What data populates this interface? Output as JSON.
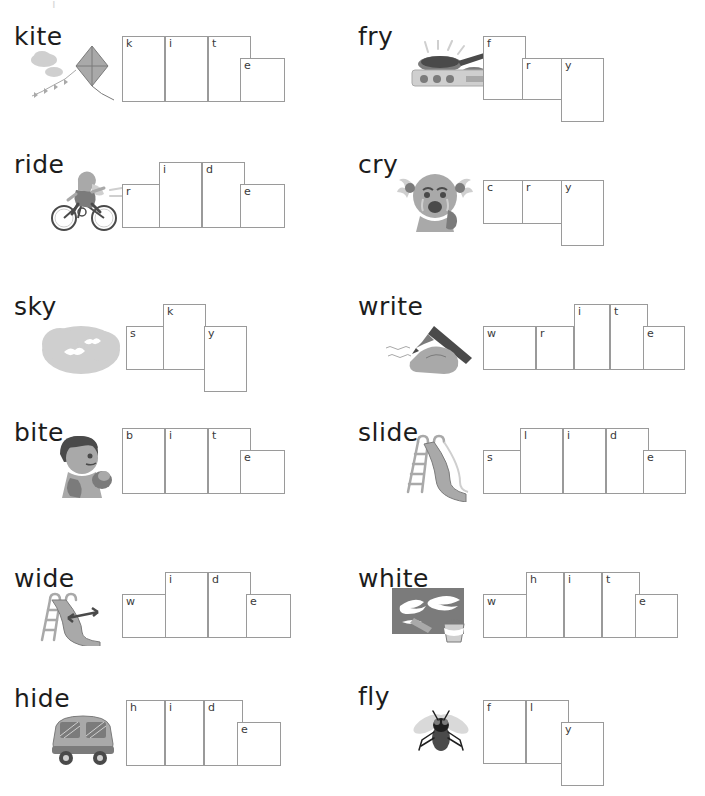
{
  "page": {
    "top_artifact": "i",
    "width": 705,
    "height": 796,
    "border_color": "#9a9a9a",
    "letter_color": "#3a3a3a",
    "word_color": "#1c1c1c"
  },
  "items": [
    {
      "word": "kite",
      "icon": "kite-icon",
      "col": 0,
      "row": 0,
      "label_x": 14,
      "label_y": 24,
      "pic_x": 22,
      "pic_y": 42,
      "pic_w": 100,
      "pic_h": 62,
      "boxes_x": 122,
      "boxes_y": 36,
      "cells": [
        {
          "letter": "k",
          "x": 0,
          "y": 0,
          "w": 43,
          "h": 66
        },
        {
          "letter": "i",
          "x": 43,
          "y": 0,
          "w": 43,
          "h": 66
        },
        {
          "letter": "t",
          "x": 86,
          "y": 0,
          "w": 43,
          "h": 66
        },
        {
          "letter": "e",
          "x": 118,
          "y": 22,
          "w": 45,
          "h": 44
        }
      ]
    },
    {
      "word": "fry",
      "icon": "frying-pan-icon",
      "col": 1,
      "row": 0,
      "label_x": 358,
      "label_y": 24,
      "pic_x": 398,
      "pic_y": 40,
      "pic_w": 110,
      "pic_h": 64,
      "boxes_x": 483,
      "boxes_y": 36,
      "cells": [
        {
          "letter": "f",
          "x": 0,
          "y": 0,
          "w": 43,
          "h": 64
        },
        {
          "letter": "r",
          "x": 39,
          "y": 22,
          "w": 43,
          "h": 42
        },
        {
          "letter": "y",
          "x": 78,
          "y": 22,
          "w": 43,
          "h": 64
        }
      ]
    },
    {
      "word": "ride",
      "icon": "bicycle-rider-icon",
      "col": 0,
      "row": 1,
      "label_x": 14,
      "label_y": 152,
      "pic_x": 48,
      "pic_y": 162,
      "pic_w": 78,
      "pic_h": 70,
      "boxes_x": 122,
      "boxes_y": 162,
      "cells": [
        {
          "letter": "r",
          "x": 0,
          "y": 22,
          "w": 43,
          "h": 44
        },
        {
          "letter": "i",
          "x": 37,
          "y": 0,
          "w": 43,
          "h": 66
        },
        {
          "letter": "d",
          "x": 80,
          "y": 0,
          "w": 43,
          "h": 66
        },
        {
          "letter": "e",
          "x": 118,
          "y": 22,
          "w": 45,
          "h": 44
        }
      ]
    },
    {
      "word": "cry",
      "icon": "crying-child-icon",
      "col": 1,
      "row": 1,
      "label_x": 358,
      "label_y": 152,
      "pic_x": 396,
      "pic_y": 162,
      "pic_w": 78,
      "pic_h": 74,
      "boxes_x": 483,
      "boxes_y": 180,
      "cells": [
        {
          "letter": "c",
          "x": 0,
          "y": 0,
          "w": 43,
          "h": 44
        },
        {
          "letter": "r",
          "x": 39,
          "y": 0,
          "w": 43,
          "h": 44
        },
        {
          "letter": "y",
          "x": 78,
          "y": 0,
          "w": 43,
          "h": 66
        }
      ]
    },
    {
      "word": "sky",
      "icon": "cloud-birds-icon",
      "col": 0,
      "row": 2,
      "label_x": 14,
      "label_y": 294,
      "pic_x": 40,
      "pic_y": 318,
      "pic_w": 82,
      "pic_h": 60,
      "boxes_x": 126,
      "boxes_y": 304,
      "cells": [
        {
          "letter": "s",
          "x": 0,
          "y": 22,
          "w": 43,
          "h": 44
        },
        {
          "letter": "k",
          "x": 37,
          "y": 0,
          "w": 43,
          "h": 66
        },
        {
          "letter": "y",
          "x": 78,
          "y": 22,
          "w": 43,
          "h": 66
        }
      ]
    },
    {
      "word": "write",
      "icon": "writing-hand-icon",
      "col": 1,
      "row": 2,
      "label_x": 358,
      "label_y": 294,
      "pic_x": 382,
      "pic_y": 322,
      "pic_w": 96,
      "pic_h": 54,
      "boxes_x": 483,
      "boxes_y": 304,
      "cells": [
        {
          "letter": "w",
          "x": 0,
          "y": 22,
          "w": 53,
          "h": 44
        },
        {
          "letter": "r",
          "x": 53,
          "y": 22,
          "w": 38,
          "h": 44
        },
        {
          "letter": "i",
          "x": 91,
          "y": 0,
          "w": 36,
          "h": 66
        },
        {
          "letter": "t",
          "x": 127,
          "y": 0,
          "w": 38,
          "h": 66
        },
        {
          "letter": "e",
          "x": 160,
          "y": 22,
          "w": 42,
          "h": 44
        }
      ]
    },
    {
      "word": "bite",
      "icon": "child-eating-icon",
      "col": 0,
      "row": 3,
      "label_x": 14,
      "label_y": 420,
      "pic_x": 50,
      "pic_y": 432,
      "pic_w": 72,
      "pic_h": 68,
      "boxes_x": 122,
      "boxes_y": 428,
      "cells": [
        {
          "letter": "b",
          "x": 0,
          "y": 0,
          "w": 43,
          "h": 66
        },
        {
          "letter": "i",
          "x": 43,
          "y": 0,
          "w": 43,
          "h": 66
        },
        {
          "letter": "t",
          "x": 86,
          "y": 0,
          "w": 43,
          "h": 66
        },
        {
          "letter": "e",
          "x": 118,
          "y": 22,
          "w": 45,
          "h": 44
        }
      ]
    },
    {
      "word": "slide",
      "icon": "playground-slide-icon",
      "col": 1,
      "row": 3,
      "label_x": 358,
      "label_y": 420,
      "pic_x": 400,
      "pic_y": 430,
      "pic_w": 80,
      "pic_h": 72,
      "boxes_x": 483,
      "boxes_y": 428,
      "cells": [
        {
          "letter": "s",
          "x": 0,
          "y": 22,
          "w": 43,
          "h": 44
        },
        {
          "letter": "l",
          "x": 37,
          "y": 0,
          "w": 43,
          "h": 66
        },
        {
          "letter": "i",
          "x": 80,
          "y": 0,
          "w": 43,
          "h": 66
        },
        {
          "letter": "d",
          "x": 123,
          "y": 0,
          "w": 43,
          "h": 66
        },
        {
          "letter": "e",
          "x": 160,
          "y": 22,
          "w": 43,
          "h": 44
        }
      ]
    },
    {
      "word": "wide",
      "icon": "wide-slide-icon",
      "col": 0,
      "row": 4,
      "label_x": 14,
      "label_y": 566,
      "pic_x": 36,
      "pic_y": 590,
      "pic_w": 86,
      "pic_h": 56,
      "boxes_x": 122,
      "boxes_y": 572,
      "cells": [
        {
          "letter": "w",
          "x": 0,
          "y": 22,
          "w": 48,
          "h": 44
        },
        {
          "letter": "i",
          "x": 43,
          "y": 0,
          "w": 43,
          "h": 66
        },
        {
          "letter": "d",
          "x": 86,
          "y": 0,
          "w": 43,
          "h": 66
        },
        {
          "letter": "e",
          "x": 124,
          "y": 22,
          "w": 45,
          "h": 44
        }
      ]
    },
    {
      "word": "white",
      "icon": "white-paint-icon",
      "col": 1,
      "row": 4,
      "label_x": 358,
      "label_y": 566,
      "pic_x": 392,
      "pic_y": 588,
      "pic_w": 82,
      "pic_h": 56,
      "boxes_x": 483,
      "boxes_y": 572,
      "cells": [
        {
          "letter": "w",
          "x": 0,
          "y": 22,
          "w": 48,
          "h": 44
        },
        {
          "letter": "h",
          "x": 43,
          "y": 0,
          "w": 38,
          "h": 66
        },
        {
          "letter": "i",
          "x": 81,
          "y": 0,
          "w": 38,
          "h": 66
        },
        {
          "letter": "t",
          "x": 119,
          "y": 0,
          "w": 38,
          "h": 66
        },
        {
          "letter": "e",
          "x": 152,
          "y": 22,
          "w": 43,
          "h": 44
        }
      ]
    },
    {
      "word": "hide",
      "icon": "car-icon",
      "col": 0,
      "row": 5,
      "label_x": 14,
      "label_y": 686,
      "pic_x": 44,
      "pic_y": 710,
      "pic_w": 78,
      "pic_h": 56,
      "boxes_x": 126,
      "boxes_y": 700,
      "cells": [
        {
          "letter": "h",
          "x": 0,
          "y": 0,
          "w": 39,
          "h": 66
        },
        {
          "letter": "i",
          "x": 39,
          "y": 0,
          "w": 39,
          "h": 66
        },
        {
          "letter": "d",
          "x": 78,
          "y": 0,
          "w": 39,
          "h": 66
        },
        {
          "letter": "e",
          "x": 111,
          "y": 22,
          "w": 44,
          "h": 44
        }
      ]
    },
    {
      "word": "fly",
      "icon": "fly-insect-icon",
      "col": 1,
      "row": 5,
      "label_x": 358,
      "label_y": 684,
      "pic_x": 408,
      "pic_y": 708,
      "pic_w": 64,
      "pic_h": 50,
      "boxes_x": 483,
      "boxes_y": 700,
      "cells": [
        {
          "letter": "f",
          "x": 0,
          "y": 0,
          "w": 43,
          "h": 64
        },
        {
          "letter": "l",
          "x": 43,
          "y": 0,
          "w": 43,
          "h": 64
        },
        {
          "letter": "y",
          "x": 78,
          "y": 22,
          "w": 43,
          "h": 64
        }
      ]
    }
  ]
}
